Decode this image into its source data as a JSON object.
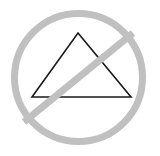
{
  "canvas": {
    "width": 160,
    "height": 156,
    "background_color": "#ffffff",
    "title": "Prohibition symbol over triangle"
  },
  "graphic": {
    "name": "no-triangle-symbol",
    "description": "A gray circle with a diagonal slash (prohibition / no-entry sign) drawn over a thin black outlined triangle",
    "prohibition_sign": {
      "stroke_color": "#c0c0c0",
      "fill": "none",
      "circle": {
        "center_x": 78.5,
        "center_y": 77.5,
        "radius": 64,
        "stroke_width": 7
      },
      "slash": {
        "x1": 24,
        "y1": 122,
        "x2": 133,
        "y2": 33,
        "stroke_width": 7,
        "direction": "lower-left-to-upper-right"
      }
    },
    "triangle": {
      "stroke_color": "#1a1a1a",
      "fill": "none",
      "stroke_width": 1.6,
      "points": [
        {
          "name": "apex",
          "x": 78,
          "y": 33
        },
        {
          "name": "bottom-right",
          "x": 131,
          "y": 97
        },
        {
          "name": "bottom-left",
          "x": 32,
          "y": 97
        }
      ]
    }
  }
}
